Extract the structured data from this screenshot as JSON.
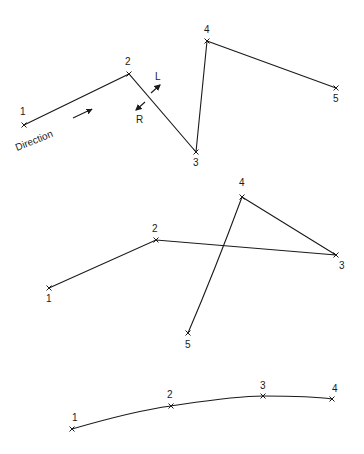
{
  "diagrams": [
    {
      "id": "traverse-zigzag",
      "points": [
        {
          "label": "1",
          "x": 24,
          "y": 125,
          "lx": 20,
          "ly": 115
        },
        {
          "label": "2",
          "x": 129,
          "y": 74,
          "lx": 125,
          "ly": 65
        },
        {
          "label": "3",
          "x": 196,
          "y": 152,
          "lx": 193,
          "ly": 166
        },
        {
          "label": "4",
          "x": 207,
          "y": 41,
          "lx": 204,
          "ly": 33
        },
        {
          "label": "5",
          "x": 336,
          "y": 88,
          "lx": 333,
          "ly": 102
        }
      ],
      "annotations": {
        "direction_label": "Direction",
        "left_label": "L",
        "right_label": "R"
      }
    },
    {
      "id": "traverse-crossing",
      "points": [
        {
          "label": "1",
          "x": 49,
          "y": 288,
          "lx": 46,
          "ly": 302
        },
        {
          "label": "2",
          "x": 156,
          "y": 240,
          "lx": 152,
          "ly": 232
        },
        {
          "label": "3",
          "x": 336,
          "y": 255,
          "lx": 339,
          "ly": 269
        },
        {
          "label": "4",
          "x": 242,
          "y": 197,
          "lx": 239,
          "ly": 186
        },
        {
          "label": "5",
          "x": 188,
          "y": 333,
          "lx": 185,
          "ly": 348
        }
      ]
    },
    {
      "id": "traverse-smooth-curve",
      "points": [
        {
          "label": "1",
          "x": 72,
          "y": 429,
          "lx": 72,
          "ly": 421
        },
        {
          "label": "2",
          "x": 171,
          "y": 406,
          "lx": 167,
          "ly": 398
        },
        {
          "label": "3",
          "x": 263,
          "y": 396,
          "lx": 260,
          "ly": 389
        },
        {
          "label": "4",
          "x": 332,
          "y": 399,
          "lx": 332,
          "ly": 392
        }
      ]
    }
  ]
}
